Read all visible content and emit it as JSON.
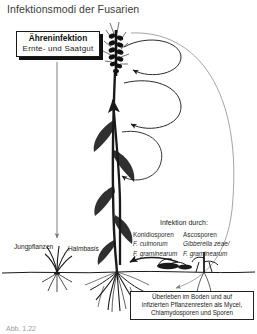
{
  "figure": {
    "title": "Infektionsmodi der Fusarien",
    "caption": "Abb. 1.22"
  },
  "callout": {
    "name": "ahreninfektion-callout",
    "line1": "Ähreninfektion",
    "line2": "Ernte- und Saatgut"
  },
  "labels": {
    "jungpflanzen": "Jungpflanzen",
    "halmbasis": "Halmbasis",
    "infektion_durch": "Infektion durch:"
  },
  "spores": {
    "conidia": {
      "heading": "Konidiosporen",
      "species1": "F. culmorum",
      "species2": "F. graminearum"
    },
    "asco": {
      "heading": "Ascosporen",
      "species1": "Gibberella zeae/",
      "species2": "F. graminearum"
    }
  },
  "survival_box": {
    "line1": "Überleben im Boden und auf",
    "line2": "infizierten Pflanzenresten als Mycel,",
    "line3": "Chlamydosporen und Sporen"
  },
  "graphic": {
    "wheat_ear": "wheat-ear-icon",
    "wheat_stem": "wheat-stem-icon",
    "roots": "roots-icon",
    "seedling": "seedling-icon",
    "crop_residue": "crop-residue-icon",
    "soil_line": "soil-line",
    "arrow_down_left": "downward-arrow",
    "arrow_loop_upper": "upper-loop-arrow",
    "arrow_loop_lower": "lower-loop-arrow",
    "arrow_big_arc": "big-arc-arrow",
    "arrow_residue_to_base": "residue-to-base-arrow",
    "arrow_up_to_ear": "upward-arrow-to-ear"
  },
  "colors": {
    "ink": "#1a1a1a",
    "arrow_light": "#8c8c8c",
    "title": "#3a3a3a",
    "background": "#ffffff"
  }
}
